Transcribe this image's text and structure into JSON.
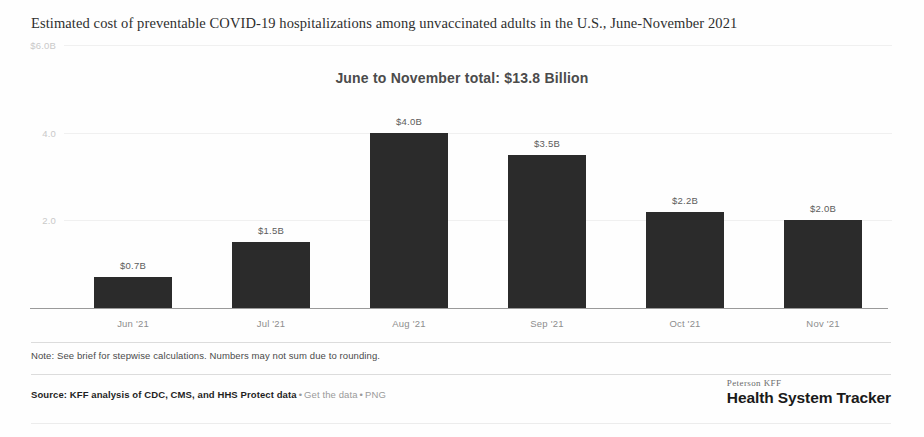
{
  "headline": "Estimated cost of preventable COVID-19 hospitalizations among unvaccinated adults in the U.S., June-November 2021",
  "chart_data": {
    "type": "bar",
    "title": "June to November total: $13.8 Billion",
    "xlabel": "",
    "ylabel": "",
    "categories": [
      "Jun '21",
      "Jul '21",
      "Aug '21",
      "Sep '21",
      "Oct '21",
      "Nov '21"
    ],
    "values": [
      0.7,
      1.5,
      4.0,
      3.5,
      2.2,
      2.0
    ],
    "value_labels": [
      "$0.7B",
      "$1.5B",
      "$4.0B",
      "$3.5B",
      "$2.2B",
      "$2.0B"
    ],
    "ylim": [
      0,
      6.0
    ],
    "yticks": [
      2.0,
      4.0,
      6.0
    ],
    "ytick_labels": [
      "2.0",
      "4.0",
      "$6.0B"
    ],
    "grid": true,
    "legend": null,
    "bar_color": "#2b2b2b",
    "units": "Billions of US dollars"
  },
  "note": "Note: See brief for stepwise calculations. Numbers may not sum due to rounding.",
  "source": {
    "main": "Source: KFF analysis of CDC, CMS, and HHS Protect data",
    "sep1": "•",
    "link1": "Get the data",
    "sep2": "•",
    "link2": "PNG"
  },
  "logo": {
    "top": "Peterson KFF",
    "main": "Health System Tracker"
  }
}
